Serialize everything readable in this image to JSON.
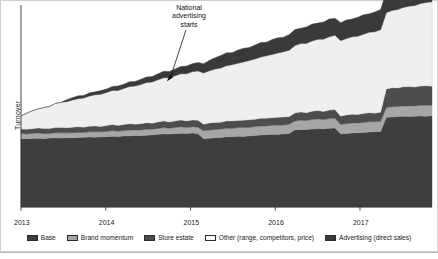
{
  "chart_data": {
    "type": "area",
    "stacked": true,
    "title": "",
    "xlabel": "",
    "ylabel": "Turnover",
    "grid": false,
    "legend_position": "bottom",
    "xlim": [
      2013.0,
      2017.85
    ],
    "ylim": [
      0,
      100
    ],
    "tick_labels": [
      "2013",
      "2014",
      "2015",
      "2016",
      "2017"
    ],
    "tick_values": [
      2013,
      2014,
      2015,
      2016,
      2017
    ],
    "annotations": [
      {
        "text": "National advertising starts",
        "text_lines": [
          "National",
          "advertising",
          "starts"
        ],
        "points_to_x": 2014.72,
        "points_to_y": 62.5
      }
    ],
    "series": [
      {
        "name": "Base",
        "color": "#3e3e3e",
        "values": [
          34.0,
          34.0,
          34.1,
          34.2,
          34.0,
          34.3,
          34.4,
          34.3,
          34.5,
          34.4,
          34.6,
          34.7,
          34.8,
          34.7,
          34.9,
          35.0,
          35.2,
          35.1,
          35.3,
          35.4,
          35.6,
          35.5,
          35.7,
          35.9,
          36.2,
          36.4,
          36.3,
          36.5,
          36.7,
          36.6,
          36.8,
          36.5,
          34.0,
          34.2,
          34.5,
          34.6,
          34.9,
          35.0,
          35.2,
          35.1,
          35.4,
          35.6,
          35.8,
          36.0,
          36.2,
          36.1,
          36.4,
          36.6,
          38.4,
          38.6,
          38.5,
          38.8,
          39.0,
          38.9,
          39.2,
          39.3,
          36.4,
          36.6,
          36.8,
          37.0,
          37.1,
          37.3,
          37.5,
          37.6,
          44.6,
          44.8,
          45.0,
          45.1,
          45.0,
          45.2,
          45.3,
          45.2,
          45.4
        ]
      },
      {
        "name": "Brand momentum",
        "color": "#a6a6a6",
        "values": [
          2.6,
          2.3,
          2.5,
          2.6,
          2.4,
          2.3,
          2.5,
          2.6,
          2.4,
          2.6,
          2.5,
          2.4,
          2.6,
          2.7,
          2.5,
          2.6,
          2.8,
          2.6,
          2.7,
          2.9,
          2.7,
          2.8,
          3.0,
          2.8,
          2.9,
          3.1,
          2.9,
          3.0,
          3.2,
          3.0,
          3.1,
          3.2,
          3.9,
          4.1,
          4.0,
          4.2,
          4.3,
          4.1,
          4.3,
          4.4,
          4.2,
          4.4,
          4.5,
          4.3,
          4.5,
          4.6,
          4.4,
          4.6,
          4.4,
          4.6,
          4.5,
          4.7,
          4.8,
          4.6,
          4.8,
          4.9,
          4.7,
          4.9,
          5.0,
          4.8,
          5.0,
          5.1,
          4.9,
          5.1,
          4.9,
          5.1,
          5.0,
          5.2,
          5.3,
          5.1,
          5.3,
          5.4,
          5.2
        ]
      },
      {
        "name": "Store estate",
        "color": "#4d4d4d",
        "values": [
          2.2,
          2.4,
          2.3,
          2.5,
          2.6,
          2.4,
          2.6,
          2.7,
          2.5,
          2.7,
          2.8,
          2.6,
          2.8,
          2.9,
          2.7,
          2.9,
          3.0,
          2.8,
          3.0,
          3.1,
          2.9,
          3.1,
          3.2,
          3.0,
          3.2,
          3.3,
          3.1,
          3.3,
          3.4,
          3.2,
          3.4,
          3.5,
          3.3,
          3.5,
          3.6,
          3.4,
          3.6,
          3.7,
          3.5,
          3.7,
          3.8,
          3.6,
          3.8,
          3.9,
          3.7,
          3.9,
          4.0,
          3.8,
          4.0,
          4.1,
          3.9,
          4.1,
          4.2,
          4.0,
          4.2,
          4.3,
          4.1,
          4.3,
          4.4,
          4.2,
          4.4,
          4.5,
          4.3,
          4.5,
          9.2,
          9.4,
          9.2,
          9.5,
          9.6,
          9.4,
          9.6,
          9.7,
          9.5
        ]
      },
      {
        "name": "Other (range, competitors, price)",
        "color": "#efefef",
        "values": [
          6.5,
          8.0,
          9.0,
          9.5,
          10.5,
          11.0,
          12.0,
          12.5,
          13.0,
          13.5,
          14.0,
          14.5,
          15.0,
          15.5,
          16.0,
          16.5,
          17.0,
          17.5,
          18.0,
          18.5,
          19.0,
          19.5,
          20.0,
          20.5,
          21.0,
          21.5,
          22.0,
          22.5,
          23.0,
          23.5,
          24.0,
          24.5,
          25.5,
          26.0,
          26.5,
          27.0,
          27.5,
          28.0,
          28.5,
          29.0,
          29.5,
          30.0,
          30.5,
          31.0,
          31.5,
          32.0,
          32.5,
          33.0,
          33.5,
          34.0,
          34.5,
          35.0,
          35.5,
          36.0,
          36.5,
          37.0,
          37.5,
          38.0,
          38.5,
          39.0,
          39.5,
          40.0,
          40.5,
          41.0,
          38.0,
          38.5,
          39.0,
          39.5,
          40.0,
          40.5,
          41.0,
          41.5,
          42.0
        ]
      },
      {
        "name": "Advertising (direct sales)",
        "color": "#3a3a3a",
        "values": [
          0.0,
          0.0,
          0.0,
          0.0,
          0.0,
          0.0,
          0.0,
          0.0,
          1.0,
          1.2,
          1.4,
          1.3,
          1.6,
          1.5,
          1.8,
          1.7,
          2.0,
          2.2,
          2.1,
          2.4,
          2.3,
          2.6,
          2.8,
          2.7,
          3.0,
          3.2,
          3.1,
          3.4,
          3.6,
          3.8,
          4.0,
          4.2,
          4.6,
          5.2,
          5.6,
          6.2,
          6.4,
          6.0,
          6.6,
          6.8,
          6.4,
          7.0,
          7.2,
          6.8,
          7.4,
          7.6,
          7.2,
          7.8,
          8.0,
          7.6,
          8.2,
          8.4,
          8.0,
          8.6,
          8.8,
          8.4,
          9.0,
          9.2,
          8.8,
          9.4,
          9.6,
          9.2,
          9.8,
          10.0,
          10.4,
          11.0,
          10.6,
          11.4,
          11.8,
          11.2,
          11.9,
          12.2,
          11.6
        ]
      }
    ]
  },
  "axis": {
    "ylabel": "Turnover"
  },
  "legend": {
    "items": [
      {
        "label": "Base",
        "color": "#3e3e3e"
      },
      {
        "label": "Brand momentum",
        "color": "#a6a6a6"
      },
      {
        "label": "Store estate",
        "color": "#4d4d4d"
      },
      {
        "label": "Other (range, competitors, price)",
        "color": "#ffffff"
      },
      {
        "label": "Advertising (direct sales)",
        "color": "#3a3a3a"
      }
    ]
  }
}
